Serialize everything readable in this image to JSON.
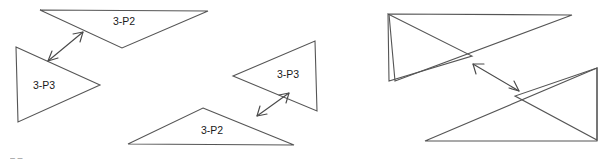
{
  "figure": {
    "canvas": {
      "width": 612,
      "height": 163,
      "background": "#ffffff"
    },
    "stroke_color": "#555555",
    "arrow_color": "#4a4a4a",
    "label_color": "#1a1a1a",
    "left_panel": {
      "name": "separated-triangles-panel",
      "shapes": [
        {
          "id": "top-triangle-3p2",
          "label": "3-P2",
          "label_x": 124,
          "label_y": 22,
          "points": "40,10 208,11 122,48",
          "orientation": "apex-down"
        },
        {
          "id": "left-triangle-3p3",
          "label": "3-P3",
          "label_x": 44,
          "label_y": 86,
          "points": "16,47 100,85 18,122",
          "orientation": "apex-right"
        },
        {
          "id": "right-triangle-3p3",
          "label": "3-P3",
          "label_x": 288,
          "label_y": 75,
          "points": "315,41 317,111 233,76",
          "orientation": "apex-left"
        },
        {
          "id": "bottom-triangle-3p2",
          "label": "3-P2",
          "label_x": 212,
          "label_y": 131,
          "points": "203,108 294,145 128,144",
          "orientation": "apex-up"
        }
      ],
      "arrows": [
        {
          "id": "arrow-top-left-pair",
          "x1": 48,
          "y1": 61,
          "x2": 83,
          "y2": 32,
          "double_headed": true
        },
        {
          "id": "arrow-bottom-right-pair",
          "x1": 257,
          "y1": 116,
          "x2": 289,
          "y2": 93,
          "double_headed": true
        }
      ]
    },
    "right_panel": {
      "name": "overlapping-triangles-panel",
      "shapes": [
        {
          "id": "upper-left-pointing-triangle",
          "points": "388,14 472,56 389,81",
          "orientation": "apex-right"
        },
        {
          "id": "upper-right-pointing-triangle",
          "points": "389,14 572,15 395,81",
          "orientation": "long-diagonal"
        },
        {
          "id": "lower-right-pointing-triangle",
          "points": "597,68 515,96 597,140",
          "orientation": "apex-left"
        },
        {
          "id": "lower-left-pointing-triangle",
          "points": "597,68 425,141 597,141",
          "orientation": "long-diagonal"
        }
      ],
      "arrows": [
        {
          "id": "arrow-between-overlapping-groups",
          "x1": 473,
          "y1": 64,
          "x2": 519,
          "y2": 91,
          "double_headed": true
        }
      ]
    },
    "artifact": {
      "id": "cropped-text-artifact",
      "text": "– –",
      "x": 10,
      "y": 159
    }
  }
}
